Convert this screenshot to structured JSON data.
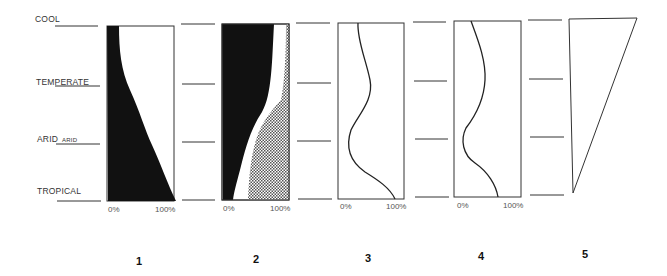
{
  "climate_labels": {
    "cool": "COOL",
    "temperate": "TEMPERATE",
    "arid": "ARID",
    "arid_small": "ARID",
    "tropical": "TROPICAL"
  },
  "axis": {
    "min_label": "0%",
    "max_label": "100%"
  },
  "panels": [
    {
      "number": "1",
      "type": "filled-area",
      "description": "Black area widening from cool to tropical"
    },
    {
      "number": "2",
      "type": "stacked-area",
      "description": "Black area, white gap, crosshatched area"
    },
    {
      "number": "3",
      "type": "line",
      "description": "Curve bulging at temperate, dipping at arid"
    },
    {
      "number": "4",
      "type": "line",
      "description": "Curve bulging at temperate, dipping at arid"
    },
    {
      "number": "5",
      "type": "triangle",
      "description": "Wedge widest at cool, narrowing to tropical"
    }
  ],
  "colors": {
    "ink": "#111111",
    "line": "#333333",
    "background": "#ffffff"
  }
}
